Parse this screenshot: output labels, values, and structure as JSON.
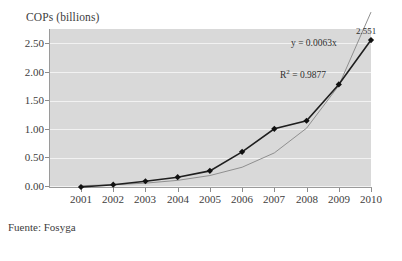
{
  "chart_data": {
    "type": "line",
    "title": "",
    "subtitle": "",
    "xlabel": "",
    "ylabel": "COPs (billions)",
    "categories": [
      "2001",
      "2002",
      "2003",
      "2004",
      "2005",
      "2006",
      "2007",
      "2008",
      "2009",
      "2010"
    ],
    "values": [
      0.0,
      0.04,
      0.1,
      0.17,
      0.28,
      0.61,
      1.01,
      1.15,
      1.78,
      2.551
    ],
    "series": [
      {
        "name": "COPs",
        "values": [
          0.0,
          0.04,
          0.1,
          0.17,
          0.28,
          0.61,
          1.01,
          1.15,
          1.78,
          2.551
        ],
        "marker": "diamond",
        "color": "#1a1a1a"
      },
      {
        "name": "trendline",
        "type": "exponential-trend",
        "color": "#8f8f8f"
      }
    ],
    "ylim": [
      0.0,
      2.75
    ],
    "yticks": [
      "0.00",
      "0.50",
      "1.00",
      "1.50",
      "2.00",
      "2.50"
    ],
    "ytick_values": [
      0.0,
      0.5,
      1.0,
      1.5,
      2.0,
      2.5
    ],
    "grid": true,
    "legend": false,
    "legend_position": "none",
    "plot_background": "#d9d9d9",
    "gridline_color": "#f2f2f2",
    "annotations": {
      "equation": "y = 0.0063x",
      "r_squared_prefix": "R",
      "r_squared_exponent": "2",
      "r_squared_value": " = 0.9877",
      "last_point_value": "2.551"
    }
  },
  "source": {
    "note": "Fuente: Fosyga"
  }
}
